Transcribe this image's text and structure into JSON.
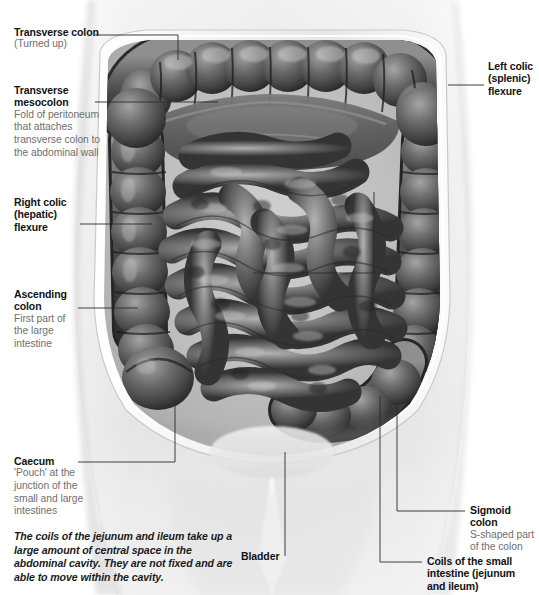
{
  "figure": {
    "kind": "anatomical-photograph",
    "palette": {
      "page_background": "#ffffff",
      "body_fill": "#e9e9e9",
      "cavity_rim": "#f4f4f4",
      "colon_dark": "#3a3a3a",
      "colon_mid": "#6e6e6e",
      "colon_light": "#a8a8a8",
      "small_intestine_dark": "#4a4a4a",
      "small_intestine_light": "#9d9d9d",
      "leader_line": "#2b2b2b",
      "title_text": "#121212",
      "sub_text": "#6f6f72",
      "caption_text": "#1b1b1b"
    }
  },
  "labels": {
    "transverse_colon": {
      "title": "Transverse colon",
      "sub": "(Turned up)"
    },
    "transverse_mesocolon": {
      "title": "Transverse\nmesocolon",
      "sub": "Fold of peritoneum\nthat attaches\ntransverse colon to\nthe abdominal wall"
    },
    "right_colic_flexure": {
      "title": "Right colic\n(hepatic)\nflexure",
      "sub": ""
    },
    "ascending_colon": {
      "title": "Ascending\ncolon",
      "sub": "First part of\nthe large\nintestine"
    },
    "caecum": {
      "title": "Caecum",
      "sub": "'Pouch' at the\njunction of the\nsmall and large\nintestines"
    },
    "left_colic_flexure": {
      "title": "Left colic\n(splenic)\nflexure",
      "sub": ""
    },
    "sigmoid_colon": {
      "title": "Sigmoid colon",
      "sub": "S-shaped part\nof the colon"
    },
    "small_intestine_coils": {
      "title": "Coils of the small\nintestine (jejunum\nand ileum)",
      "sub": ""
    },
    "bladder": {
      "title": "Bladder",
      "sub": ""
    }
  },
  "caption": {
    "text": "The coils of the jejunum and ileum take up a large amount of central space in the abdominal cavity. They are not fixed and are able to move within the cavity."
  }
}
